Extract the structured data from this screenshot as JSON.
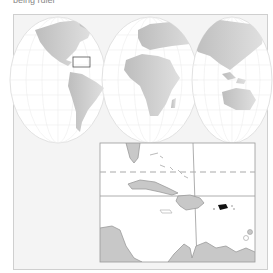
{
  "caption": "being ruler",
  "map": {
    "projection": "interrupted world map",
    "highlight": "Puerto Rico",
    "locator_box_region": "Caribbean",
    "colors": {
      "land": "#c8c8c8",
      "land_outline": "#9a9a9a",
      "ocean": "#ffffff",
      "highlight": "#111111",
      "frame_bg": "#f4f4f4"
    }
  },
  "inset": {
    "label": "Caribbean detail",
    "tropic_line": "dashed"
  }
}
